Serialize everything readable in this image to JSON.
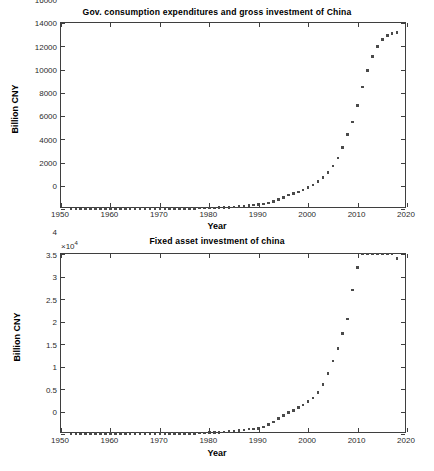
{
  "figure": {
    "width": 434,
    "height": 471,
    "background": "#ffffff",
    "marker_color": "#4a4a4a",
    "axis_color": "#3f3f3f"
  },
  "chart_data": [
    {
      "type": "scatter",
      "title": "Gov. consumption expenditures and gross investment of China",
      "xlabel": "Year",
      "ylabel": "Billion CNY",
      "grid": false,
      "legend": "none",
      "xlim": [
        1950,
        2020
      ],
      "ylim": [
        0,
        16000
      ],
      "xticks": [
        1950,
        1960,
        1970,
        1980,
        1990,
        2000,
        2010,
        2020
      ],
      "xticklabels": [
        "1950",
        "1960",
        "1970",
        "1980",
        "1990",
        "2000",
        "2010",
        "2020"
      ],
      "yticks": [
        0,
        2000,
        4000,
        6000,
        8000,
        10000,
        12000,
        14000,
        16000
      ],
      "yticklabels": [
        "0",
        "2000",
        "4000",
        "6000",
        "8000",
        "10000",
        "12000",
        "14000",
        "16000"
      ],
      "y_multiplier": null,
      "series": [
        {
          "name": "Gov. consumption expenditures and gross investment",
          "marker": "square",
          "x": [
            1952,
            1953,
            1954,
            1955,
            1956,
            1957,
            1958,
            1959,
            1960,
            1961,
            1962,
            1963,
            1964,
            1965,
            1966,
            1967,
            1968,
            1969,
            1970,
            1971,
            1972,
            1973,
            1974,
            1975,
            1976,
            1977,
            1978,
            1979,
            1980,
            1981,
            1982,
            1983,
            1984,
            1985,
            1986,
            1987,
            1988,
            1989,
            1990,
            1991,
            1992,
            1993,
            1994,
            1995,
            1996,
            1997,
            1998,
            1999,
            2000,
            2001,
            2002,
            2003,
            2004,
            2005,
            2006,
            2007,
            2008,
            2009,
            2010,
            2011,
            2012,
            2013,
            2014,
            2015,
            2016,
            2017,
            2018
          ],
          "y": [
            12,
            15,
            17,
            18,
            22,
            24,
            33,
            38,
            38,
            26,
            22,
            25,
            28,
            33,
            34,
            30,
            28,
            34,
            41,
            44,
            45,
            48,
            50,
            55,
            55,
            59,
            70,
            80,
            87,
            95,
            106,
            122,
            147,
            184,
            213,
            243,
            290,
            330,
            370,
            420,
            500,
            630,
            820,
            1010,
            1200,
            1340,
            1470,
            1640,
            1850,
            2080,
            2350,
            2700,
            3150,
            3700,
            4400,
            5300,
            6400,
            7500,
            8900,
            10500,
            11900,
            13100,
            14000,
            14600,
            14900,
            15100,
            15200
          ]
        }
      ]
    },
    {
      "type": "scatter",
      "title": "Fixed asset investment of china",
      "xlabel": "Year",
      "ylabel": "Billion CNY",
      "grid": false,
      "legend": "none",
      "xlim": [
        1950,
        2020
      ],
      "ylim": [
        0,
        40000
      ],
      "xticks": [
        1950,
        1960,
        1970,
        1980,
        1990,
        2000,
        2010,
        2020
      ],
      "xticklabels": [
        "1950",
        "1960",
        "1970",
        "1980",
        "1990",
        "2000",
        "2010",
        "2020"
      ],
      "yticks": [
        0,
        5000,
        10000,
        15000,
        20000,
        25000,
        30000,
        35000,
        40000
      ],
      "yticklabels": [
        "0",
        "0.5",
        "1",
        "1.5",
        "2",
        "2.5",
        "3",
        "3.5",
        "4"
      ],
      "y_multiplier": "×10",
      "y_multiplier_exp": "4",
      "series": [
        {
          "name": "Fixed asset investment",
          "marker": "square",
          "x": [
            1952,
            1953,
            1954,
            1955,
            1956,
            1957,
            1958,
            1959,
            1960,
            1961,
            1962,
            1963,
            1964,
            1965,
            1966,
            1967,
            1968,
            1969,
            1970,
            1971,
            1972,
            1973,
            1974,
            1975,
            1976,
            1977,
            1978,
            1979,
            1980,
            1981,
            1982,
            1983,
            1984,
            1985,
            1986,
            1987,
            1988,
            1989,
            1990,
            1991,
            1992,
            1993,
            1994,
            1995,
            1996,
            1997,
            1998,
            1999,
            2000,
            2001,
            2002,
            2003,
            2004,
            2005,
            2006,
            2007,
            2008,
            2009,
            2010,
            2011,
            2012,
            2013,
            2014,
            2015,
            2016,
            2017,
            2018
          ],
          "y": [
            20,
            30,
            35,
            40,
            55,
            60,
            90,
            110,
            110,
            60,
            45,
            55,
            65,
            85,
            90,
            70,
            60,
            85,
            110,
            120,
            125,
            135,
            145,
            160,
            155,
            170,
            220,
            250,
            280,
            310,
            350,
            420,
            520,
            680,
            790,
            920,
            1080,
            1130,
            1270,
            1560,
            2060,
            2700,
            3480,
            4090,
            4780,
            5240,
            5840,
            6450,
            7280,
            8020,
            9260,
            10960,
            13500,
            16200,
            19000,
            22300,
            25600,
            32000,
            37000,
            42000,
            46000,
            50000,
            56000,
            59000,
            61000,
            64000,
            39000
          ]
        }
      ]
    }
  ]
}
